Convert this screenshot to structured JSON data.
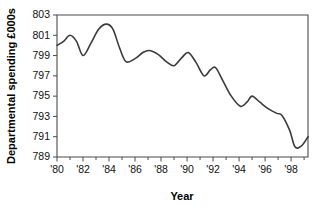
{
  "chart_data": {
    "type": "line",
    "title": "",
    "xlabel": "Year",
    "ylabel": "Departmental spending £000s",
    "xlim": [
      1980,
      1999.3
    ],
    "ylim": [
      789,
      803
    ],
    "grid": false,
    "legend": "none",
    "line_color": "#3b3b3b",
    "axis_color": "#4a4a4a",
    "x_tick_labels": [
      "'80",
      "'82",
      "'84",
      "'86",
      "'88",
      "'90",
      "'92",
      "'94",
      "'96",
      "'98"
    ],
    "x_tick_values": [
      1980,
      1982,
      1984,
      1986,
      1988,
      1990,
      1992,
      1994,
      1996,
      1998
    ],
    "x_minor_tick_values": [
      1981,
      1983,
      1985,
      1987,
      1989,
      1991,
      1993,
      1995,
      1997,
      1999
    ],
    "y_tick_labels": [
      "789",
      "791",
      "793",
      "795",
      "797",
      "799",
      "801",
      "803"
    ],
    "y_tick_values": [
      789,
      791,
      793,
      795,
      797,
      799,
      801,
      803
    ],
    "x": [
      1980.0,
      1980.5,
      1981.0,
      1981.5,
      1982.0,
      1982.6,
      1983.2,
      1983.8,
      1984.3,
      1984.8,
      1985.3,
      1986.0,
      1986.6,
      1987.1,
      1987.8,
      1988.4,
      1989.0,
      1989.6,
      1990.1,
      1990.7,
      1991.3,
      1991.8,
      1992.2,
      1992.8,
      1993.4,
      1994.1,
      1994.6,
      1995.0,
      1995.6,
      1996.2,
      1996.9,
      1997.3,
      1997.9,
      1998.3,
      1998.8,
      1999.3
    ],
    "y": [
      800.0,
      800.4,
      801.0,
      800.4,
      799.0,
      800.2,
      801.6,
      802.1,
      801.6,
      799.8,
      798.4,
      798.7,
      799.3,
      799.5,
      799.1,
      798.4,
      798.0,
      798.8,
      799.3,
      798.3,
      797.0,
      797.6,
      797.8,
      796.4,
      795.0,
      794.0,
      794.4,
      795.0,
      794.4,
      793.8,
      793.3,
      793.1,
      791.6,
      790.0,
      790.1,
      791.0
    ],
    "values_note": "Departmental spending in £000s, annual series 1980–1999"
  },
  "plot": {
    "left": 57,
    "right": 308,
    "top": 15,
    "bottom": 157
  }
}
